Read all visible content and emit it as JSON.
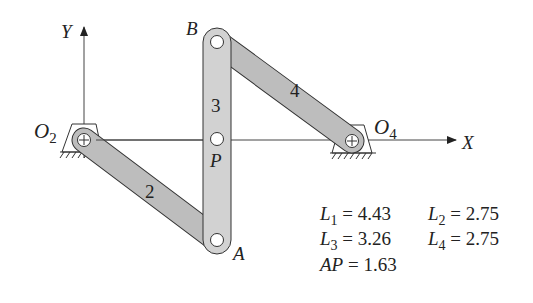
{
  "diagram": {
    "type": "four-bar linkage",
    "axes": {
      "x_label": "X",
      "y_label": "Y"
    },
    "points": {
      "O2": {
        "label": "O",
        "sub": "2"
      },
      "O4": {
        "label": "O",
        "sub": "4"
      },
      "A": {
        "label": "A"
      },
      "B": {
        "label": "B"
      },
      "P": {
        "label": "P"
      }
    },
    "links": [
      {
        "id": "2",
        "label": "2",
        "from": "O2",
        "to": "A"
      },
      {
        "id": "3",
        "label": "3",
        "from": "A",
        "to": "B"
      },
      {
        "id": "4",
        "label": "4",
        "from": "B",
        "to": "O4"
      }
    ],
    "colors": {
      "link_main": "#d2d2d2",
      "link_side": "#bdbdbd",
      "outline": "#333333",
      "axis": "#444444"
    },
    "parameters": [
      {
        "sym": "L",
        "sub": "1",
        "eq": " = 4.43"
      },
      {
        "sym": "L",
        "sub": "2",
        "eq": " = 2.75"
      },
      {
        "sym": "L",
        "sub": "3",
        "eq": " = 3.26"
      },
      {
        "sym": "L",
        "sub": "4",
        "eq": " = 2.75"
      },
      {
        "sym": "AP",
        "sub": "",
        "eq": " = 1.63"
      }
    ]
  }
}
